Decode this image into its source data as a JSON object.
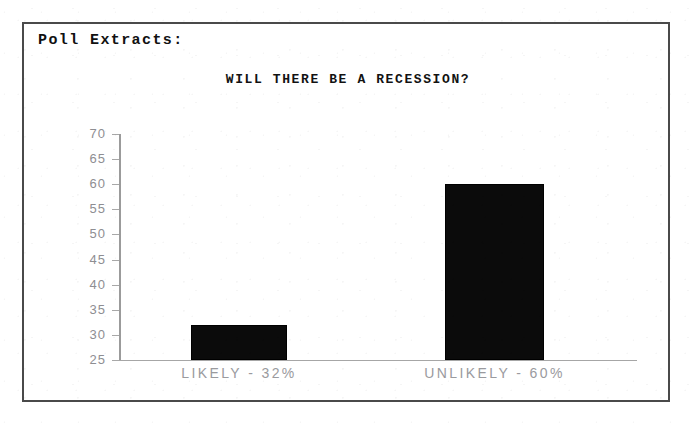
{
  "page": {
    "cutoff_top_text": "the next 6 months.",
    "box_heading": "Poll Extracts:"
  },
  "chart_data": {
    "type": "bar",
    "title": "WILL THERE BE A RECESSION?",
    "xlabel": "",
    "ylabel": "",
    "categories": [
      "LIKELY - 32%",
      "UNLIKELY - 60%"
    ],
    "values": [
      32,
      60
    ],
    "ylim": [
      25,
      70
    ],
    "yticks": [
      70,
      65,
      60,
      55,
      50,
      45,
      40,
      35,
      30,
      25
    ],
    "ytick_labels": [
      "70",
      "65",
      "60",
      "55",
      "50",
      "45",
      "40",
      "35",
      "30",
      "25"
    ],
    "grid": false,
    "legend": false,
    "bar_color": "#0b0b0b",
    "axis_color": "#9b9b9b",
    "label_color": "#9a9a9e",
    "annotations": [
      {
        "category": "LIKELY",
        "percent": "32%"
      },
      {
        "category": "UNLIKELY",
        "percent": "60%"
      }
    ]
  }
}
